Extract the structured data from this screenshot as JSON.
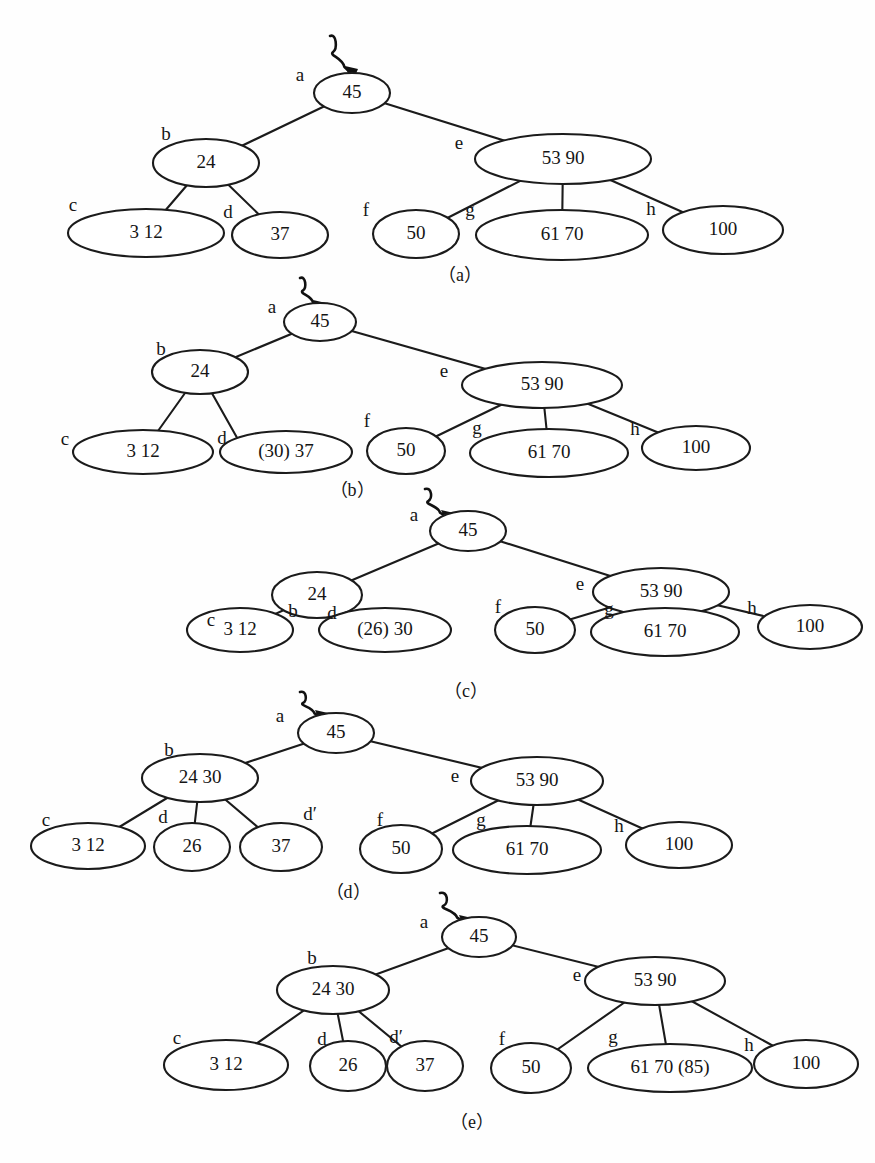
{
  "figure": {
    "background_color": "#fefefe",
    "ink_color": "#1b1b1b",
    "panel_count": 5,
    "root_pointer_icon": "squiggly-arrow-icon"
  },
  "panels": [
    {
      "id": "a",
      "caption": "（a）",
      "caption_x": 460,
      "caption_y": 277,
      "pointer": {
        "x": 330,
        "y": 36,
        "target_x": 352,
        "target_y": 74
      },
      "nodes": [
        {
          "key": "a",
          "tag": "a",
          "value": "45",
          "cx": 352,
          "cy": 93,
          "rx": 38,
          "ry": 20,
          "tag_x": 300,
          "tag_y": 77
        },
        {
          "key": "b",
          "tag": "b",
          "value": "24",
          "cx": 206,
          "cy": 163,
          "rx": 53,
          "ry": 24,
          "tag_x": 166,
          "tag_y": 136
        },
        {
          "key": "e",
          "tag": "e",
          "value": "53  90",
          "cx": 563,
          "cy": 159,
          "rx": 88,
          "ry": 25,
          "tag_x": 459,
          "tag_y": 145
        },
        {
          "key": "c",
          "tag": "c",
          "value": "3  12",
          "cx": 146,
          "cy": 233,
          "rx": 78,
          "ry": 24,
          "tag_x": 73,
          "tag_y": 207
        },
        {
          "key": "d",
          "tag": "d",
          "value": "37",
          "cx": 280,
          "cy": 235,
          "rx": 48,
          "ry": 23,
          "tag_x": 228,
          "tag_y": 214
        },
        {
          "key": "f",
          "tag": "f",
          "value": "50",
          "cx": 416,
          "cy": 234,
          "rx": 43,
          "ry": 24,
          "tag_x": 366,
          "tag_y": 212
        },
        {
          "key": "g",
          "tag": "g",
          "value": "61  70",
          "cx": 562,
          "cy": 235,
          "rx": 86,
          "ry": 25,
          "tag_x": 470,
          "tag_y": 212
        },
        {
          "key": "h",
          "tag": "h",
          "value": "100",
          "cx": 723,
          "cy": 230,
          "rx": 60,
          "ry": 24,
          "tag_x": 651,
          "tag_y": 211
        }
      ],
      "edges": [
        [
          352,
          93,
          206,
          163
        ],
        [
          352,
          93,
          563,
          159
        ],
        [
          206,
          163,
          146,
          233
        ],
        [
          206,
          163,
          280,
          235
        ],
        [
          563,
          159,
          416,
          234
        ],
        [
          563,
          159,
          562,
          235
        ],
        [
          563,
          159,
          723,
          230
        ]
      ]
    },
    {
      "id": "b",
      "caption": "（b）",
      "caption_x": 352,
      "caption_y": 492,
      "pointer": {
        "x": 300,
        "y": 278,
        "target_x": 320,
        "target_y": 308
      },
      "nodes": [
        {
          "key": "a",
          "tag": "a",
          "value": "45",
          "cx": 320,
          "cy": 322,
          "rx": 36,
          "ry": 19,
          "tag_x": 272,
          "tag_y": 309
        },
        {
          "key": "b",
          "tag": "b",
          "value": "24",
          "cx": 200,
          "cy": 372,
          "rx": 48,
          "ry": 22,
          "tag_x": 161,
          "tag_y": 351
        },
        {
          "key": "e",
          "tag": "e",
          "value": "53 90",
          "cx": 542,
          "cy": 385,
          "rx": 80,
          "ry": 23,
          "tag_x": 444,
          "tag_y": 373
        },
        {
          "key": "c",
          "tag": "c",
          "value": "3   12",
          "cx": 143,
          "cy": 452,
          "rx": 70,
          "ry": 22,
          "tag_x": 65,
          "tag_y": 441
        },
        {
          "key": "d",
          "tag": "d",
          "value": "(30)  37",
          "cx": 286,
          "cy": 452,
          "rx": 66,
          "ry": 21,
          "tag_x": 222,
          "tag_y": 440
        },
        {
          "key": "f",
          "tag": "f",
          "value": "50",
          "cx": 406,
          "cy": 451,
          "rx": 39,
          "ry": 23,
          "tag_x": 367,
          "tag_y": 423
        },
        {
          "key": "g",
          "tag": "g",
          "value": "61 70",
          "cx": 549,
          "cy": 453,
          "rx": 79,
          "ry": 24,
          "tag_x": 477,
          "tag_y": 430
        },
        {
          "key": "h",
          "tag": "h",
          "value": "100",
          "cx": 696,
          "cy": 448,
          "rx": 54,
          "ry": 22,
          "tag_x": 635,
          "tag_y": 431
        }
      ],
      "edges": [
        [
          320,
          322,
          200,
          372
        ],
        [
          320,
          322,
          542,
          385
        ],
        [
          200,
          372,
          143,
          452
        ],
        [
          200,
          372,
          240,
          443
        ],
        [
          542,
          385,
          406,
          451
        ],
        [
          542,
          385,
          549,
          453
        ],
        [
          542,
          385,
          696,
          448
        ]
      ]
    },
    {
      "id": "c",
      "caption": "（c）",
      "caption_x": 466,
      "caption_y": 693,
      "pointer": {
        "x": 425,
        "y": 489,
        "target_x": 448,
        "target_y": 518
      },
      "nodes": [
        {
          "key": "a",
          "tag": "a",
          "value": "45",
          "cx": 468,
          "cy": 531,
          "rx": 38,
          "ry": 20,
          "tag_x": 414,
          "tag_y": 517
        },
        {
          "key": "b",
          "tag": "b",
          "value": "24",
          "cx": 317,
          "cy": 595,
          "rx": 45,
          "ry": 23,
          "tag_x": 293,
          "tag_y": 613
        },
        {
          "key": "e",
          "tag": "e",
          "value": "53  90",
          "cx": 661,
          "cy": 592,
          "rx": 68,
          "ry": 24,
          "tag_x": 580,
          "tag_y": 586
        },
        {
          "key": "c",
          "tag": "c",
          "value": "3    12",
          "cx": 240,
          "cy": 630,
          "rx": 53,
          "ry": 22,
          "tag_x": 211,
          "tag_y": 622
        },
        {
          "key": "d",
          "tag": "d",
          "value": "(26)  30",
          "cx": 385,
          "cy": 630,
          "rx": 66,
          "ry": 22,
          "tag_x": 332,
          "tag_y": 615
        },
        {
          "key": "f",
          "tag": "f",
          "value": "50",
          "cx": 535,
          "cy": 630,
          "rx": 40,
          "ry": 23,
          "tag_x": 498,
          "tag_y": 609
        },
        {
          "key": "g",
          "tag": "g",
          "value": "61   70",
          "cx": 665,
          "cy": 632,
          "rx": 74,
          "ry": 24,
          "tag_x": 609,
          "tag_y": 611
        },
        {
          "key": "h",
          "tag": "h",
          "value": "100",
          "cx": 810,
          "cy": 627,
          "rx": 52,
          "ry": 22,
          "tag_x": 752,
          "tag_y": 610
        }
      ],
      "edges": [
        [
          468,
          531,
          317,
          595
        ],
        [
          468,
          531,
          661,
          592
        ],
        [
          317,
          595,
          240,
          630
        ],
        [
          317,
          595,
          385,
          630
        ],
        [
          661,
          592,
          535,
          630
        ],
        [
          661,
          592,
          665,
          632
        ],
        [
          661,
          592,
          810,
          627
        ]
      ]
    },
    {
      "id": "d",
      "caption": "（d）",
      "caption_x": 348,
      "caption_y": 894,
      "pointer": {
        "x": 300,
        "y": 692,
        "target_x": 322,
        "target_y": 718
      },
      "nodes": [
        {
          "key": "a",
          "tag": "a",
          "value": "45",
          "cx": 336,
          "cy": 733,
          "rx": 38,
          "ry": 20,
          "tag_x": 280,
          "tag_y": 718
        },
        {
          "key": "b",
          "tag": "b",
          "value": "24  30",
          "cx": 200,
          "cy": 778,
          "rx": 58,
          "ry": 24,
          "tag_x": 169,
          "tag_y": 752
        },
        {
          "key": "e",
          "tag": "e",
          "value": "53   90",
          "cx": 537,
          "cy": 781,
          "rx": 66,
          "ry": 24,
          "tag_x": 455,
          "tag_y": 778
        },
        {
          "key": "c",
          "tag": "c",
          "value": "3    12",
          "cx": 88,
          "cy": 846,
          "rx": 57,
          "ry": 23,
          "tag_x": 46,
          "tag_y": 822
        },
        {
          "key": "d",
          "tag": "d",
          "value": "26",
          "cx": 192,
          "cy": 847,
          "rx": 38,
          "ry": 24,
          "tag_x": 163,
          "tag_y": 819
        },
        {
          "key": "d2",
          "tag": "d′",
          "value": "37",
          "cx": 281,
          "cy": 847,
          "rx": 41,
          "ry": 24,
          "tag_x": 310,
          "tag_y": 816
        },
        {
          "key": "f",
          "tag": "f",
          "value": "50",
          "cx": 401,
          "cy": 849,
          "rx": 41,
          "ry": 24,
          "tag_x": 380,
          "tag_y": 822
        },
        {
          "key": "g",
          "tag": "g",
          "value": "61   70",
          "cx": 527,
          "cy": 850,
          "rx": 74,
          "ry": 24,
          "tag_x": 481,
          "tag_y": 822
        },
        {
          "key": "h",
          "tag": "h",
          "value": "100",
          "cx": 679,
          "cy": 845,
          "rx": 53,
          "ry": 23,
          "tag_x": 619,
          "tag_y": 828
        }
      ],
      "edges": [
        [
          336,
          733,
          200,
          778
        ],
        [
          336,
          733,
          537,
          781
        ],
        [
          200,
          778,
          88,
          846
        ],
        [
          200,
          778,
          192,
          847
        ],
        [
          200,
          778,
          281,
          847
        ],
        [
          537,
          781,
          401,
          849
        ],
        [
          537,
          781,
          527,
          850
        ],
        [
          537,
          781,
          679,
          845
        ]
      ]
    },
    {
      "id": "e",
      "caption": "（e）",
      "caption_x": 472,
      "caption_y": 1124,
      "pointer": {
        "x": 440,
        "y": 893,
        "target_x": 466,
        "target_y": 923
      },
      "nodes": [
        {
          "key": "a",
          "tag": "a",
          "value": "45",
          "cx": 479,
          "cy": 937,
          "rx": 37,
          "ry": 20,
          "tag_x": 424,
          "tag_y": 924
        },
        {
          "key": "b",
          "tag": "b",
          "value": "24 30",
          "cx": 333,
          "cy": 990,
          "rx": 56,
          "ry": 24,
          "tag_x": 312,
          "tag_y": 960
        },
        {
          "key": "e",
          "tag": "e",
          "value": "53   90",
          "cx": 655,
          "cy": 981,
          "rx": 70,
          "ry": 24,
          "tag_x": 577,
          "tag_y": 977
        },
        {
          "key": "c",
          "tag": "c",
          "value": "3     12",
          "cx": 226,
          "cy": 1065,
          "rx": 62,
          "ry": 25,
          "tag_x": 177,
          "tag_y": 1040
        },
        {
          "key": "d",
          "tag": "d",
          "value": "26",
          "cx": 348,
          "cy": 1066,
          "rx": 38,
          "ry": 25,
          "tag_x": 322,
          "tag_y": 1041
        },
        {
          "key": "d2",
          "tag": "d′",
          "value": "37",
          "cx": 425,
          "cy": 1066,
          "rx": 38,
          "ry": 25,
          "tag_x": 396,
          "tag_y": 1039
        },
        {
          "key": "f",
          "tag": "f",
          "value": "50",
          "cx": 531,
          "cy": 1068,
          "rx": 40,
          "ry": 25,
          "tag_x": 502,
          "tag_y": 1041
        },
        {
          "key": "g",
          "tag": "g",
          "value": "61 70    (85)",
          "cx": 670,
          "cy": 1068,
          "rx": 82,
          "ry": 24,
          "tag_x": 613,
          "tag_y": 1039
        },
        {
          "key": "h",
          "tag": "h",
          "value": "100",
          "cx": 806,
          "cy": 1064,
          "rx": 52,
          "ry": 24,
          "tag_x": 749,
          "tag_y": 1047
        }
      ],
      "edges": [
        [
          479,
          937,
          333,
          990
        ],
        [
          479,
          937,
          655,
          981
        ],
        [
          333,
          990,
          226,
          1065
        ],
        [
          333,
          990,
          348,
          1066
        ],
        [
          333,
          990,
          425,
          1066
        ],
        [
          655,
          981,
          531,
          1068
        ],
        [
          655,
          981,
          670,
          1068
        ],
        [
          655,
          981,
          806,
          1064
        ]
      ]
    }
  ],
  "tree_states": {
    "a": {
      "description": "initial B-tree before insertion",
      "root": {
        "label": "a",
        "keys": [
          "45"
        ]
      },
      "level2": [
        {
          "label": "b",
          "keys": [
            "24"
          ]
        },
        {
          "label": "e",
          "keys": [
            "53",
            "90"
          ]
        }
      ],
      "level3": [
        {
          "label": "c",
          "keys": [
            "3",
            "12"
          ]
        },
        {
          "label": "d",
          "keys": [
            "37"
          ]
        },
        {
          "label": "f",
          "keys": [
            "50"
          ]
        },
        {
          "label": "g",
          "keys": [
            "61",
            "70"
          ]
        },
        {
          "label": "h",
          "keys": [
            "100"
          ]
        }
      ]
    },
    "b": {
      "description": "key 30 inserted into node d",
      "root": {
        "label": "a",
        "keys": [
          "45"
        ]
      },
      "level2": [
        {
          "label": "b",
          "keys": [
            "24"
          ]
        },
        {
          "label": "e",
          "keys": [
            "53",
            "90"
          ]
        }
      ],
      "level3": [
        {
          "label": "c",
          "keys": [
            "3",
            "12"
          ]
        },
        {
          "label": "d",
          "keys": [
            "(30)",
            "37"
          ]
        },
        {
          "label": "f",
          "keys": [
            "50"
          ]
        },
        {
          "label": "g",
          "keys": [
            "61",
            "70"
          ]
        },
        {
          "label": "h",
          "keys": [
            "100"
          ]
        }
      ]
    },
    "c": {
      "description": "key 26 inserted into node d causing overflow",
      "root": {
        "label": "a",
        "keys": [
          "45"
        ]
      },
      "level2": [
        {
          "label": "b",
          "keys": [
            "24"
          ]
        },
        {
          "label": "e",
          "keys": [
            "53",
            "90"
          ]
        }
      ],
      "level3": [
        {
          "label": "c",
          "keys": [
            "3",
            "12"
          ]
        },
        {
          "label": "d",
          "keys": [
            "(26)",
            "30"
          ]
        },
        {
          "label": "f",
          "keys": [
            "50"
          ]
        },
        {
          "label": "g",
          "keys": [
            "61",
            "70"
          ]
        },
        {
          "label": "h",
          "keys": [
            "100"
          ]
        }
      ]
    },
    "d": {
      "description": "node d split into d and d-prime, key 30 promoted into b",
      "root": {
        "label": "a",
        "keys": [
          "45"
        ]
      },
      "level2": [
        {
          "label": "b",
          "keys": [
            "24",
            "30"
          ]
        },
        {
          "label": "e",
          "keys": [
            "53",
            "90"
          ]
        }
      ],
      "level3": [
        {
          "label": "c",
          "keys": [
            "3",
            "12"
          ]
        },
        {
          "label": "d",
          "keys": [
            "26"
          ]
        },
        {
          "label": "d′",
          "keys": [
            "37"
          ]
        },
        {
          "label": "f",
          "keys": [
            "50"
          ]
        },
        {
          "label": "g",
          "keys": [
            "61",
            "70"
          ]
        },
        {
          "label": "h",
          "keys": [
            "100"
          ]
        }
      ]
    },
    "e": {
      "description": "key 85 inserted into node g",
      "root": {
        "label": "a",
        "keys": [
          "45"
        ]
      },
      "level2": [
        {
          "label": "b",
          "keys": [
            "24",
            "30"
          ]
        },
        {
          "label": "e",
          "keys": [
            "53",
            "90"
          ]
        }
      ],
      "level3": [
        {
          "label": "c",
          "keys": [
            "3",
            "12"
          ]
        },
        {
          "label": "d",
          "keys": [
            "26"
          ]
        },
        {
          "label": "d′",
          "keys": [
            "37"
          ]
        },
        {
          "label": "f",
          "keys": [
            "50"
          ]
        },
        {
          "label": "g",
          "keys": [
            "61",
            "70",
            "(85)"
          ]
        },
        {
          "label": "h",
          "keys": [
            "100"
          ]
        }
      ]
    }
  }
}
